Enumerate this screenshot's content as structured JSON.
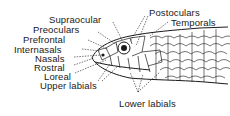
{
  "diagram": {
    "labels_left": [
      {
        "id": "supraocular",
        "text": "Supraocular"
      },
      {
        "id": "preoculars",
        "text": "Preoculars"
      },
      {
        "id": "prefrontal",
        "text": "Prefrontal"
      },
      {
        "id": "internasals",
        "text": "Internasals"
      },
      {
        "id": "nasals",
        "text": "Nasals"
      },
      {
        "id": "rostral",
        "text": "Rostral"
      },
      {
        "id": "loreal",
        "text": "Loreal"
      },
      {
        "id": "upper_labials",
        "text": "Upper labials"
      }
    ],
    "labels_right": [
      {
        "id": "postoculars",
        "text": "Postoculars"
      },
      {
        "id": "temporals",
        "text": "Temporals"
      },
      {
        "id": "lower_labials",
        "text": "Lower labials"
      }
    ],
    "colors": {
      "ink": "#1a1a1a",
      "background": "#ffffff"
    }
  }
}
